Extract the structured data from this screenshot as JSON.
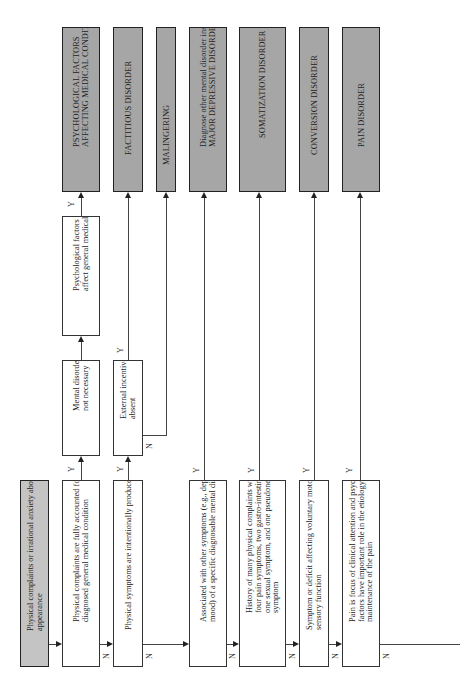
{
  "start": {
    "label": "Physical complaints or irrational anxiety about appearance"
  },
  "questions": [
    {
      "label": "Physical complaints are fully accounted for by a diagnosed general medical condition"
    },
    {
      "label": "Physical symptoms are intentionally produced"
    },
    {
      "label": "Associated with other symptoms (e.g., depressed mood) of a specific diagnosable mental disorder"
    },
    {
      "label": "History of many physical complaints with at least four pain symptoms, two gastro-intestinal symptoms, one sexual symptom, and one pseudoneurological symptom"
    },
    {
      "label": "Symptom or deficit affecting voluntary motor or sensory function"
    },
    {
      "label": "Pain is focus of clinical attention and psychological factors have important role in the etiology or maintenance of the pain"
    }
  ],
  "intermediate": {
    "mental_disorder": "Mental disorder diagnosis not necessary",
    "external_incentives": "External incentives are absent",
    "psych_factors": "Psychological factors adversely affect general medical condition"
  },
  "diagnoses": [
    {
      "label": "PSYCHOLOGICAL FACTORS AFFECTING MEDICAL CONDITION"
    },
    {
      "label": "FACTITIOUS DISORDER"
    },
    {
      "label": "MALINGERING"
    },
    {
      "label": "Diagnose other mental disorder instead (e.g., MAJOR DEPRESSIVE DISORDER)"
    },
    {
      "label": "SOMATIZATION DISORDER"
    },
    {
      "label": "CONVERSION DISORDER"
    },
    {
      "label": "PAIN DISORDER"
    }
  ],
  "edge_labels": {
    "yes": "Y",
    "no": "N"
  },
  "colors": {
    "diagnosis_fill": "#a6a6a6",
    "start_fill": "#c4c4c4",
    "line": "#444444"
  }
}
